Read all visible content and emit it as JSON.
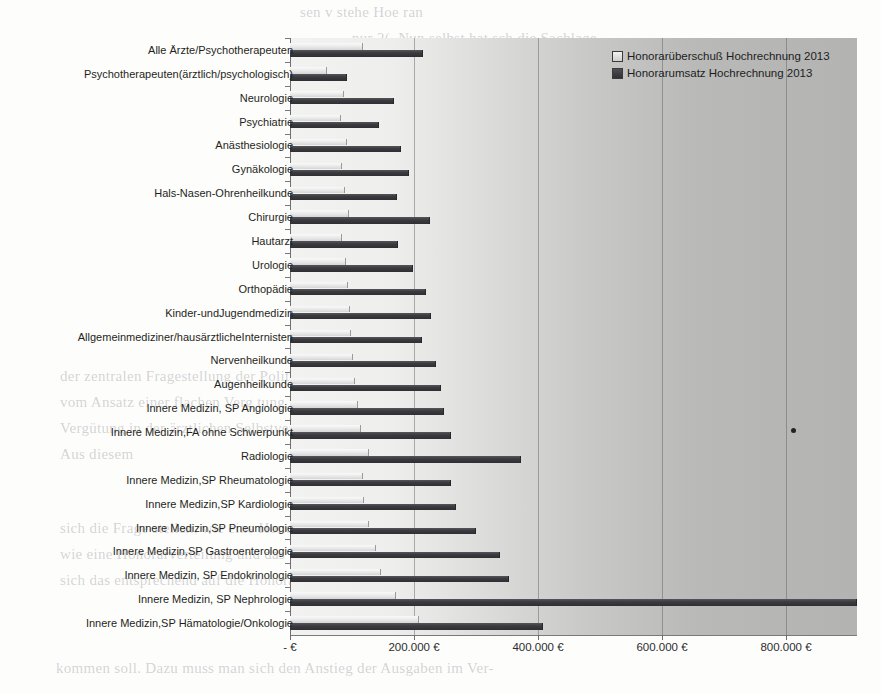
{
  "chart_data": {
    "type": "bar",
    "orientation": "horizontal",
    "title": "",
    "xlabel": "",
    "ylabel": "",
    "xlim": [
      0,
      915000
    ],
    "grid": true,
    "legend_position": "top-right",
    "xtick_labels": [
      "- €",
      "200.000 €",
      "400.000 €",
      "600.000 €",
      "800.000 €"
    ],
    "xtick_values": [
      0,
      200000,
      400000,
      600000,
      800000
    ],
    "categories": [
      "Alle Ärzte/Psychotherapeuten",
      "Psychotherapeuten(ärztlich/psychologisch)",
      "Neurologie",
      "Psychiatrie",
      "Anästhesiologie",
      "Gynäkologie",
      "Hals-Nasen-Ohrenheilkunde",
      "Chirurgie",
      "Hautarzt",
      "Urologie",
      "Orthopädie",
      "Kinder-undJugendmedizin",
      "Allgemeinmediziner/hausärztlicheInternisten",
      "Nervenheilkunde",
      "Augenheilkunde",
      "Innere Medizin, SP Angiologie",
      "Innere Medizin,FA ohne Schwerpunkt",
      "Radiologie",
      "Innere Medizin,SP Rheumatologie",
      "Innere Medizin,SP Kardiologie",
      "Innere Medizin,SP Pneumologie",
      "Innere Medizin,SP Gastroenterologie",
      "Innere Medizin, SP Endokrinologie",
      "Innere Medizin, SP Nephrologie",
      "Innere Medizin,SP Hämatologie/Onkologie"
    ],
    "series": [
      {
        "name": "Honorarüberschuß Hochrechnung 2013",
        "color": "#e4e4e4",
        "values": [
          116000,
          58000,
          85000,
          81000,
          90000,
          82000,
          87000,
          94000,
          82000,
          89000,
          92000,
          95000,
          97000,
          100000,
          103000,
          108000,
          113000,
          126000,
          116000,
          118000,
          126000,
          137000,
          145000,
          170000,
          206000
        ]
      },
      {
        "name": "Honorarumsatz Hochrechnung 2013",
        "color": "#343439",
        "values": [
          213000,
          90000,
          166000,
          142000,
          177000,
          190000,
          171000,
          224000,
          172000,
          197000,
          218000,
          226000,
          211000,
          234000,
          242000,
          247000,
          258000,
          371000,
          258000,
          266000,
          299000,
          337000,
          352000,
          913000,
          406000
        ]
      }
    ],
    "annotations": [
      {
        "name": "ink-dot",
        "x": 810000,
        "note": "stray ink dot artifact"
      }
    ]
  },
  "legend": {
    "items": [
      {
        "label": "Honorarüberschuß Hochrechnung 2013",
        "swatch": "light"
      },
      {
        "label": "Honorarumsatz Hochrechnung 2013",
        "swatch": "dark"
      }
    ]
  },
  "background_text": [
    {
      "text": "sen v stehe Hoe  ran",
      "x": 300,
      "y": 4,
      "size": 15
    },
    {
      "text": "nur 2(. Nun selbst hat sch die Sachlage",
      "x": 352,
      "y": 30,
      "size": 15
    },
    {
      "text": "Gebührenordnun und Innovationen der UN Die aber für eine Verzögerung der",
      "x": 330,
      "y": 120,
      "size": 14
    },
    {
      "text": "Weiterentwicklung des Leistungsverzeichnisses und damit eine ne ue Hür-",
      "x": 332,
      "y": 146,
      "size": 14
    },
    {
      "text": "Nach EBM und Gesetzlich oder Kranken Kr Abrechnung EBM bewe-",
      "x": 334,
      "y": 172,
      "size": 14
    },
    {
      "text": "k nur die gesetzlichen Krankenkassen Die und auch",
      "x": 332,
      "y": 198,
      "size": 14
    },
    {
      "text": "rung in die kassenärztliche Vergütung in der Aufstellung 2013",
      "x": 330,
      "y": 224,
      "size": 14
    },
    {
      "text": "ihr Wandel der Vergütung ist in die",
      "x": 430,
      "y": 300,
      "size": 14
    },
    {
      "text": "der zentralen Fragestellung der Politik und Rat der KBV im",
      "x": 60,
      "y": 368,
      "size": 15
    },
    {
      "text": "vom Ansatz einer flachen Verg tung hin zu einer",
      "x": 60,
      "y": 394,
      "size": 15
    },
    {
      "text": "Vergütung in der ärztlichen Selbstverwaltung.",
      "x": 60,
      "y": 420,
      "size": 15
    },
    {
      "text": "Aus diesem",
      "x": 60,
      "y": 446,
      "size": 15
    },
    {
      "text": "sich die Frage stellen, wie eine Honorarverteilung in",
      "x": 60,
      "y": 520,
      "size": 15
    },
    {
      "text": "wie eine Honorarverteilung und das Verhältnis der",
      "x": 60,
      "y": 546,
      "size": 15
    },
    {
      "text": "sich das entsprechend auf die Honorare auswirken",
      "x": 60,
      "y": 572,
      "size": 15
    },
    {
      "text": "kommen soll. Dazu muss man sich den Anstieg der Ausgaben im Ver-",
      "x": 56,
      "y": 660,
      "size": 15
    }
  ]
}
